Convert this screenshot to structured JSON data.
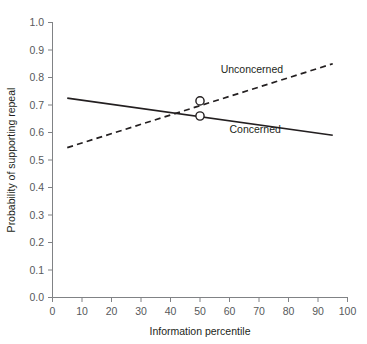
{
  "chart_data": {
    "type": "line",
    "title": "",
    "xlabel": "Information percentile",
    "ylabel": "Probability of supporting repeal",
    "xlim": [
      0,
      100
    ],
    "ylim": [
      0.0,
      1.0
    ],
    "xticks": [
      0,
      10,
      20,
      30,
      40,
      50,
      60,
      70,
      80,
      90,
      100
    ],
    "xtick_labels": [
      "0",
      "10",
      "20",
      "30",
      "40",
      "50",
      "60",
      "70",
      "80",
      "90",
      "100"
    ],
    "yticks": [
      0.0,
      0.1,
      0.2,
      0.3,
      0.4,
      0.5,
      0.6,
      0.7,
      0.8,
      0.9,
      1.0
    ],
    "ytick_labels": [
      "0.0",
      "0.1",
      "0.2",
      "0.3",
      "0.4",
      "0.5",
      "0.6",
      "0.7",
      "0.8",
      "0.9",
      "1.0"
    ],
    "grid": false,
    "legend_position": "inline-annotations",
    "series": [
      {
        "name": "Unconcerned",
        "style": "dashed",
        "color": "#231f20",
        "x": [
          5,
          95
        ],
        "values": [
          0.545,
          0.85
        ],
        "label_text": "Unconcerned",
        "label_x": 57,
        "label_y": 0.815,
        "marker": {
          "x": 50,
          "y": 0.715,
          "shape": "open-circle"
        }
      },
      {
        "name": "Concerned",
        "style": "solid",
        "color": "#231f20",
        "x": [
          5,
          95
        ],
        "values": [
          0.725,
          0.59
        ],
        "label_text": "Concerned",
        "label_x": 60,
        "label_y": 0.6,
        "marker": {
          "x": 50,
          "y": 0.66,
          "shape": "open-circle"
        }
      }
    ]
  },
  "labels": {
    "y_axis_title": "Probability of supporting repeal",
    "x_axis_title": "Information percentile",
    "series_unconcerned": "Unconcerned",
    "series_concerned": "Concerned"
  },
  "ticks": {
    "x": [
      "0",
      "10",
      "20",
      "30",
      "40",
      "50",
      "60",
      "70",
      "80",
      "90",
      "100"
    ],
    "y": [
      "1.0",
      "0.9",
      "0.8",
      "0.7",
      "0.6",
      "0.5",
      "0.4",
      "0.3",
      "0.2",
      "0.1",
      "0.0"
    ]
  },
  "colors": {
    "line": "#231f20",
    "axis": "#808285",
    "tick_text": "#58595b",
    "title_text": "#231f20",
    "background": "#ffffff"
  }
}
